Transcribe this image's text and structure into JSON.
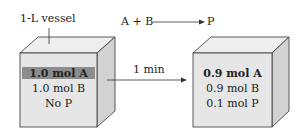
{
  "vessel_label": "1-L vessel",
  "reaction": {
    "lhs": "A + B",
    "rhs": "P"
  },
  "time_label": "1 min",
  "initial": {
    "lines": [
      "1.0 mol A",
      "1.0 mol B",
      "No P"
    ],
    "highlighted_line": 0
  },
  "final": {
    "lines": [
      "0.9 mol A",
      "0.9 mol B",
      "0.1 mol P"
    ],
    "bold_line": 0
  },
  "colors": {
    "front": "#e6e6e6",
    "top": "#efefef",
    "side": "#d2d2d2",
    "highlight": "#8d8d8d",
    "stroke": "#333333"
  }
}
